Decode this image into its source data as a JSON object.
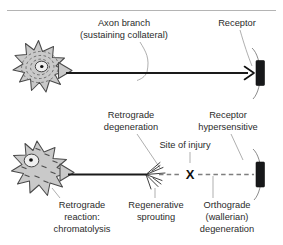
{
  "figure": {
    "background_color": "#ffffff",
    "width": 283,
    "height": 245
  },
  "panels": [
    {
      "id": "normal-neuron",
      "name": "Normal neuron panel",
      "labels": {
        "axon_branch_line1": "Axon branch",
        "axon_branch_line2": "(sustaining collateral)",
        "receptor": "Receptor"
      },
      "structures": {
        "soma": "stellate cell body with concentric Nissl substance",
        "nucleus": "central nucleus with nucleolus",
        "axon": "intact solid axon",
        "terminal": "receptor end plate with nerve terminal fork"
      }
    },
    {
      "id": "injured-neuron",
      "name": "Injured neuron panel",
      "labels": {
        "retrograde_degeneration_line1": "Retrograde",
        "retrograde_degeneration_line2": "degeneration",
        "receptor_hypersensitive_line1": "Receptor",
        "receptor_hypersensitive_line2": "hypersensitive",
        "site_of_injury": "Site of injury",
        "injury_marker": "X",
        "retrograde_reaction_line1": "Retrograde",
        "retrograde_reaction_line2": "reaction:",
        "retrograde_reaction_line3": "chromatolysis",
        "regenerative_sprouting_line1": "Regenerative",
        "regenerative_sprouting_line2": "sprouting",
        "orthograde_degeneration_line1": "Orthograde",
        "orthograde_degeneration_line2": "(wallerian)",
        "orthograde_degeneration_line3": "degeneration"
      },
      "structures": {
        "soma": "swollen stellate cell body with dispersed Nissl substance",
        "nucleus": "eccentric displaced nucleus with nucleolus",
        "axon_proximal": "solid proximal axon stump",
        "sprouts": "regenerative sprouting fibers at axon tip",
        "axon_distal": "dashed degenerating distal axon",
        "terminal": "denervated receptor end plate"
      }
    }
  ],
  "colors": {
    "soma_fill": "#c9c9c9",
    "soma_outline": "#4a4a4a",
    "nucleus_fill": "#efefef",
    "nucleolus": "#111111",
    "axon_intact": "#1a1a1a",
    "axon_degenerating": "#7e7e7e",
    "receptor_plate": "#17181a",
    "leader_line": "#8d8d8d",
    "label_text": "#2b2b2b",
    "top_rule": "#b4b4b4"
  }
}
